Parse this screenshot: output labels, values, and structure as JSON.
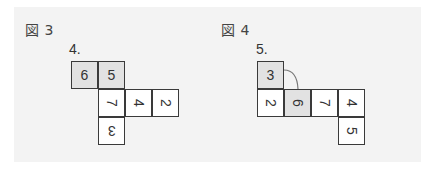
{
  "figures": [
    {
      "label": "図 3",
      "problem": "4.",
      "cells": [
        {
          "digit": "6",
          "rotation": "rot0",
          "shaded": true,
          "x": 71,
          "y": 61
        },
        {
          "digit": "5",
          "rotation": "rot0",
          "shaded": true,
          "x": 98,
          "y": 61
        },
        {
          "digit": "7",
          "rotation": "rot90",
          "shaded": false,
          "x": 98,
          "y": 89
        },
        {
          "digit": "4",
          "rotation": "rot90",
          "shaded": false,
          "x": 125,
          "y": 89
        },
        {
          "digit": "2",
          "rotation": "rot90",
          "shaded": false,
          "x": 152,
          "y": 89
        },
        {
          "digit": "3",
          "rotation": "rot180",
          "shaded": false,
          "x": 98,
          "y": 117
        }
      ]
    },
    {
      "label": "図 4",
      "problem": "5.",
      "cells": [
        {
          "digit": "3",
          "rotation": "rot0",
          "shaded": true,
          "x": 257,
          "y": 61
        },
        {
          "digit": "2",
          "rotation": "rot90",
          "shaded": false,
          "x": 257,
          "y": 89
        },
        {
          "digit": "6",
          "rotation": "rot90",
          "shaded": true,
          "x": 284,
          "y": 89
        },
        {
          "digit": "7",
          "rotation": "rot90",
          "shaded": false,
          "x": 311,
          "y": 89
        },
        {
          "digit": "4",
          "rotation": "rot90",
          "shaded": false,
          "x": 338,
          "y": 89
        },
        {
          "digit": "5",
          "rotation": "rot90",
          "shaded": false,
          "x": 338,
          "y": 117
        }
      ],
      "connector": "arc from right edge of cell 3 to top edge of cell 6"
    }
  ],
  "colors": {
    "panel_bg": "#f3f3f3",
    "shaded_cell": "#e2e2e2",
    "border": "#3a3a3a",
    "connector": "#777777"
  }
}
